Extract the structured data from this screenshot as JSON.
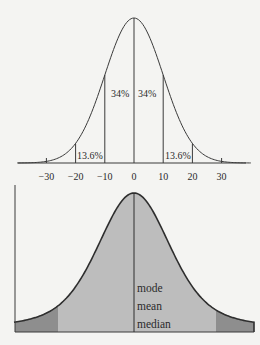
{
  "chart_data": [
    {
      "type": "area",
      "title": "",
      "description": "Normal distribution curve with standard deviation bands",
      "xlabel": "",
      "ylabel": "",
      "x_ticks": [
        -30,
        -20,
        -10,
        0,
        10,
        20,
        30
      ],
      "x_tick_labels": [
        "−30",
        "−20",
        "−10",
        "0",
        "10",
        "20",
        "30"
      ],
      "mean": 0,
      "sd": 10,
      "xlim": [
        -40,
        40
      ],
      "vertical_lines_at": [
        -20,
        -10,
        0,
        10,
        20
      ],
      "annotations": [
        {
          "x_range": [
            -10,
            0
          ],
          "label": "34%"
        },
        {
          "x_range": [
            0,
            10
          ],
          "label": "34%"
        },
        {
          "x_range": [
            -20,
            -10
          ],
          "label": "13.6%"
        },
        {
          "x_range": [
            10,
            20
          ],
          "label": "13.6%"
        }
      ],
      "grid": false
    },
    {
      "type": "area",
      "title": "",
      "description": "Symmetric bell curve, shaded, with central line marking mode, mean and median",
      "xlabel": "",
      "ylabel": "",
      "center_labels": [
        "mode",
        "mean",
        "median"
      ],
      "shaded_regions": [
        {
          "region": "center",
          "color": "#bdbdbd"
        },
        {
          "region": "left-tail",
          "color": "#8e8e8e"
        },
        {
          "region": "right-tail",
          "color": "#8e8e8e"
        }
      ],
      "grid": false
    }
  ],
  "colors": {
    "background": "#f4f4f2",
    "line": "#3a3a3a",
    "fill_main": "#bdbdbd",
    "fill_tail": "#8e8e8e"
  }
}
